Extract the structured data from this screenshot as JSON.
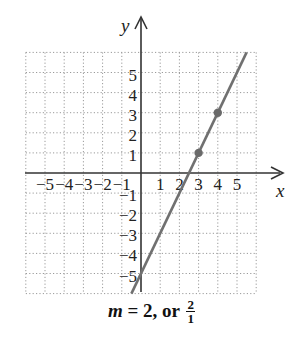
{
  "chart_data": {
    "type": "line",
    "title": "",
    "xlabel": "x",
    "ylabel": "y",
    "xlim": [
      -6,
      6
    ],
    "ylim": [
      -6,
      6
    ],
    "grid": true,
    "grid_style": "dotted",
    "x_ticks": [
      -5,
      -4,
      -3,
      -2,
      -1,
      1,
      2,
      3,
      4,
      5
    ],
    "y_ticks": [
      5,
      4,
      3,
      2,
      1,
      -1,
      -2,
      -3,
      -4,
      -5
    ],
    "x_tick_labels": [
      "−5",
      "−4",
      "−3",
      "−2",
      "−1",
      "1",
      "2",
      "3",
      "4",
      "5"
    ],
    "y_tick_labels": [
      "5",
      "4",
      "3",
      "2",
      "1",
      "−1",
      "−2",
      "−3",
      "−4",
      "−5"
    ],
    "series": [
      {
        "name": "y = 2x − 5",
        "kind": "line",
        "x": [
          -0.5,
          5.5
        ],
        "y": [
          -6,
          6
        ],
        "color": "#707070"
      },
      {
        "name": "marked points",
        "kind": "points",
        "x": [
          3,
          4
        ],
        "y": [
          1,
          3
        ],
        "color": "#6a6a6a"
      }
    ],
    "slope": 2,
    "y_intercept": -5,
    "annotation": "m = 2, or 2/1"
  },
  "caption": {
    "variable": "m",
    "equals": " = 2, or ",
    "frac_num": "2",
    "frac_den": "1"
  },
  "colors": {
    "line": "#707070",
    "points": "#6a6a6a",
    "axes": "#333333",
    "grid": "#9a9a9a"
  }
}
